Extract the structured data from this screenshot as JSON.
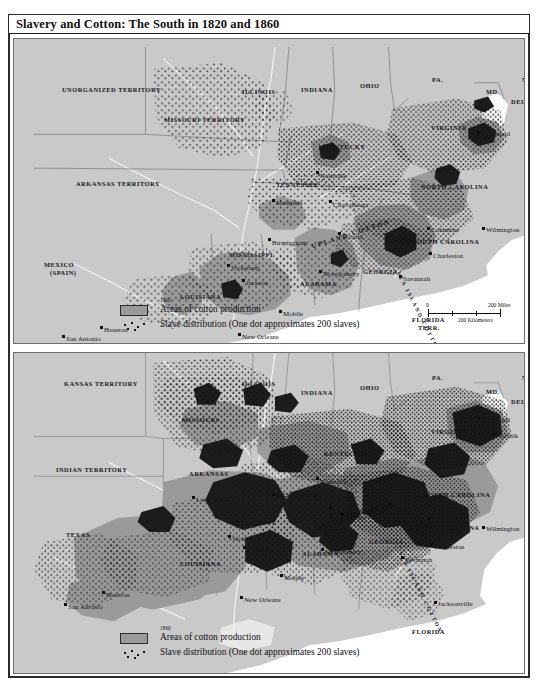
{
  "plate": {
    "title": "Slavery and Cotton: The South in 1820 and 1860"
  },
  "maps": [
    {
      "id": "map-1820",
      "year": "1820",
      "legend": {
        "cotton": "Areas of cotton production",
        "slaves": "Slave distribution (One dot approximates 200 slaves)"
      },
      "scale": {
        "miles_zero": "0",
        "miles": "200 Miles",
        "km_zero": "0",
        "km": "200 Kilometers"
      },
      "crop_labels": [
        "UPLAND COTTON",
        "SEA ISLAND COTTON"
      ],
      "territories": [
        {
          "name": "UNORGANIZED TERRITORY",
          "x": 48,
          "y": 48
        },
        {
          "name": "MISSOURI TERRITORY",
          "x": 150,
          "y": 78
        },
        {
          "name": "ARKANSAS TERRITORY",
          "x": 62,
          "y": 142
        },
        {
          "name": "MEXICO",
          "x": 30,
          "y": 223
        },
        {
          "name": "(Spain)",
          "x": 36,
          "y": 231
        },
        {
          "name": "FLORIDA",
          "x": 398,
          "y": 278
        },
        {
          "name": "TERR.",
          "x": 404,
          "y": 286
        }
      ],
      "states": [
        {
          "name": "ILLINOIS",
          "x": 228,
          "y": 50
        },
        {
          "name": "INDIANA",
          "x": 287,
          "y": 48
        },
        {
          "name": "OHIO",
          "x": 346,
          "y": 44
        },
        {
          "name": "PA.",
          "x": 418,
          "y": 38
        },
        {
          "name": "N.J.",
          "x": 508,
          "y": 38
        },
        {
          "name": "MD.",
          "x": 472,
          "y": 50
        },
        {
          "name": "DEL.",
          "x": 497,
          "y": 60
        },
        {
          "name": "VIRGINIA",
          "x": 417,
          "y": 86
        },
        {
          "name": "KENTUCKY",
          "x": 310,
          "y": 105
        },
        {
          "name": "TENNESSEE",
          "x": 262,
          "y": 143
        },
        {
          "name": "NORTH CAROLINA",
          "x": 407,
          "y": 145
        },
        {
          "name": "SOUTH CAROLINA",
          "x": 399,
          "y": 200
        },
        {
          "name": "GEORGIA",
          "x": 349,
          "y": 230
        },
        {
          "name": "ALABAMA",
          "x": 286,
          "y": 242
        },
        {
          "name": "MISSISSIPPI",
          "x": 215,
          "y": 213
        },
        {
          "name": "LOUISIANA",
          "x": 166,
          "y": 255
        }
      ],
      "cities": [
        {
          "name": "Richmond",
          "x": 463,
          "y": 92,
          "dx": -7,
          "dy": 3
        },
        {
          "name": "Nashville",
          "x": 302,
          "y": 132,
          "dx": -5,
          "dy": 5
        },
        {
          "name": "Memphis",
          "x": 258,
          "y": 160,
          "dx": -5,
          "dy": 4
        },
        {
          "name": "Chattanooga",
          "x": 315,
          "y": 161,
          "dx": -6,
          "dy": 5
        },
        {
          "name": "Columbia",
          "x": 413,
          "y": 188,
          "dx": -7,
          "dy": 3
        },
        {
          "name": "Wilmington",
          "x": 468,
          "y": 188,
          "dx": -8,
          "dy": 3
        },
        {
          "name": "Charleston",
          "x": 415,
          "y": 213,
          "dx": -6,
          "dy": 4
        },
        {
          "name": "Atlanta",
          "x": 324,
          "y": 193,
          "dx": -5,
          "dy": 5
        },
        {
          "name": "Birmingham",
          "x": 254,
          "y": 199,
          "dx": -6,
          "dy": 5
        },
        {
          "name": "Montgomery",
          "x": 305,
          "y": 231,
          "dx": -6,
          "dy": 4
        },
        {
          "name": "Savannah",
          "x": 385,
          "y": 236,
          "dx": -6,
          "dy": 4
        },
        {
          "name": "Vicksburg",
          "x": 213,
          "y": 225,
          "dx": -5,
          "dy": 4
        },
        {
          "name": "Jackson",
          "x": 228,
          "y": 240,
          "dx": -5,
          "dy": 4
        },
        {
          "name": "Mobile",
          "x": 265,
          "y": 271,
          "dx": -5,
          "dy": 4
        },
        {
          "name": "New Orleans",
          "x": 224,
          "y": 294,
          "dx": -6,
          "dy": 4
        },
        {
          "name": "Houston",
          "x": 86,
          "y": 287,
          "dx": -5,
          "dy": 4
        },
        {
          "name": "San Antonio",
          "x": 48,
          "y": 296,
          "dx": -6,
          "dy": 4
        }
      ]
    },
    {
      "id": "map-1860",
      "year": "1860",
      "legend": {
        "cotton": "Areas of cotton production",
        "slaves": "Slave distribution (One dot approximates 200 slaves)"
      },
      "crop_labels": [
        "UPLAND COTTON",
        "SEA ISLAND COTTON"
      ],
      "territories": [
        {
          "name": "KANSAS TERRITORY",
          "x": 50,
          "y": 28
        },
        {
          "name": "INDIAN TERRITORY",
          "x": 42,
          "y": 114
        },
        {
          "name": "FLORIDA",
          "x": 398,
          "y": 276
        }
      ],
      "states": [
        {
          "name": "ILLINOIS",
          "x": 228,
          "y": 28
        },
        {
          "name": "INDIANA",
          "x": 287,
          "y": 37
        },
        {
          "name": "OHIO",
          "x": 346,
          "y": 32
        },
        {
          "name": "PA.",
          "x": 418,
          "y": 22
        },
        {
          "name": "N.J.",
          "x": 508,
          "y": 22
        },
        {
          "name": "MD.",
          "x": 472,
          "y": 36
        },
        {
          "name": "DEL.",
          "x": 497,
          "y": 46
        },
        {
          "name": "VIRGINIA",
          "x": 417,
          "y": 76
        },
        {
          "name": "MISSOURI",
          "x": 168,
          "y": 64
        },
        {
          "name": "KENTUCKY",
          "x": 310,
          "y": 98
        },
        {
          "name": "TENNESSEE",
          "x": 262,
          "y": 139
        },
        {
          "name": "ARKANSAS",
          "x": 175,
          "y": 118
        },
        {
          "name": "NORTH CAROLINA",
          "x": 409,
          "y": 139
        },
        {
          "name": "SOUTH CAROLINA",
          "x": 399,
          "y": 172
        },
        {
          "name": "GEORGIA",
          "x": 355,
          "y": 186
        },
        {
          "name": "ALABAMA",
          "x": 288,
          "y": 198
        },
        {
          "name": "MISSISSIPPI",
          "x": 217,
          "y": 167
        },
        {
          "name": "LOUISIANA",
          "x": 166,
          "y": 208
        },
        {
          "name": "TEXAS",
          "x": 52,
          "y": 179
        }
      ],
      "cities": [
        {
          "name": "Richmond",
          "x": 463,
          "y": 64,
          "dx": -7,
          "dy": 3
        },
        {
          "name": "Norfolk",
          "x": 478,
          "y": 80,
          "dx": -7,
          "dy": 3
        },
        {
          "name": "Nashville",
          "x": 302,
          "y": 124,
          "dx": -5,
          "dy": 5
        },
        {
          "name": "Memphis",
          "x": 258,
          "y": 140,
          "dx": -5,
          "dy": 4
        },
        {
          "name": "Chattanooga",
          "x": 315,
          "y": 153,
          "dx": -6,
          "dy": 5
        },
        {
          "name": "Little Rock",
          "x": 178,
          "y": 143,
          "dx": -6,
          "dy": 4
        },
        {
          "name": "Columbia",
          "x": 414,
          "y": 164,
          "dx": -7,
          "dy": 3
        },
        {
          "name": "Wilmington",
          "x": 468,
          "y": 173,
          "dx": -8,
          "dy": 3
        },
        {
          "name": "Charleston",
          "x": 416,
          "y": 190,
          "dx": -6,
          "dy": 4
        },
        {
          "name": "Atlanta",
          "x": 327,
          "y": 160,
          "dx": -5,
          "dy": 5
        },
        {
          "name": "Savannah",
          "x": 387,
          "y": 203,
          "dx": -6,
          "dy": 4
        },
        {
          "name": "Montgomery",
          "x": 307,
          "y": 195,
          "dx": -6,
          "dy": 4
        },
        {
          "name": "Vicksburg",
          "x": 214,
          "y": 182,
          "dx": -5,
          "dy": 4
        },
        {
          "name": "Jackson",
          "x": 229,
          "y": 193,
          "dx": -5,
          "dy": 4
        },
        {
          "name": "Mobile",
          "x": 266,
          "y": 221,
          "dx": -5,
          "dy": 4
        },
        {
          "name": "New Orleans",
          "x": 226,
          "y": 243,
          "dx": -6,
          "dy": 4
        },
        {
          "name": "Houston",
          "x": 88,
          "y": 238,
          "dx": -5,
          "dy": 4
        },
        {
          "name": "San Antonio",
          "x": 50,
          "y": 250,
          "dx": -6,
          "dy": 4
        },
        {
          "name": "Jacksonville",
          "x": 420,
          "y": 248,
          "dx": -6,
          "dy": 3
        }
      ]
    }
  ],
  "colors": {
    "land": "#c9c9c9",
    "cotton_light": "#9a9a9a",
    "cotton_dark": "#1c1c1c",
    "ocean": "#ffffff",
    "ink": "#15161a"
  }
}
